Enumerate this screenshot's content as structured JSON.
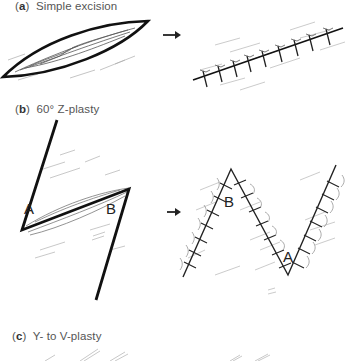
{
  "panels": [
    {
      "letter": "a",
      "title": "Simple excision"
    },
    {
      "letter": "b",
      "title": "60° Z-plasty",
      "point_labels": [
        "A",
        "B"
      ],
      "result_point_labels": [
        "B",
        "A"
      ]
    },
    {
      "letter": "c",
      "title": "Y- to V-plasty"
    }
  ],
  "colors": {
    "line": "#111111",
    "sketch": "#9a9a9a",
    "text": "#555555"
  }
}
